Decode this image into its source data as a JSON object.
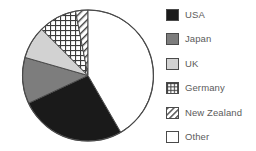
{
  "chart_data": {
    "type": "pie",
    "title": "",
    "categories": [
      "USA",
      "Japan",
      "UK",
      "Germany",
      "New Zealand",
      "Other"
    ],
    "values": [
      26.5,
      11.5,
      8.0,
      9.5,
      3.0,
      41.5
    ],
    "units": "percent",
    "start_angle_deg": 0,
    "direction": "clockwise",
    "legend_position": "right",
    "grid": false,
    "slices": [
      {
        "label": "USA",
        "value": 26.5,
        "start_deg": 150.0,
        "end_deg": 245.0,
        "fill": "#1a1a1a",
        "pattern": "solid"
      },
      {
        "label": "Japan",
        "value": 11.5,
        "start_deg": 245.0,
        "end_deg": 286.0,
        "fill": "#7d7d7d",
        "pattern": "solid"
      },
      {
        "label": "UK",
        "value": 8.0,
        "start_deg": 286.0,
        "end_deg": 315.0,
        "fill": "#d2d2d2",
        "pattern": "solid"
      },
      {
        "label": "Germany",
        "value": 9.5,
        "start_deg": 315.0,
        "end_deg": 349.0,
        "fill": "#ffffff",
        "pattern": "grid-dots"
      },
      {
        "label": "New Zealand",
        "value": 3.0,
        "start_deg": 349.0,
        "end_deg": 360.0,
        "fill": "#ffffff",
        "pattern": "diagonal-hatch"
      },
      {
        "label": "Other",
        "value": 41.5,
        "start_deg": 0.0,
        "end_deg": 150.0,
        "fill": "#ffffff",
        "pattern": "solid"
      }
    ],
    "colors": {
      "usa": "#1a1a1a",
      "japan": "#7d7d7d",
      "uk": "#d2d2d2",
      "germany": "#ffffff",
      "new_zealand": "#ffffff",
      "other": "#ffffff",
      "outline": "#4a4a4a",
      "label_text": "#5b5b5b",
      "background": "#ffffff"
    }
  },
  "legend": {
    "items": [
      {
        "label": "USA",
        "swatch": "solid-black-swatch"
      },
      {
        "label": "Japan",
        "swatch": "solid-gray-swatch"
      },
      {
        "label": "UK",
        "swatch": "solid-light-gray-swatch"
      },
      {
        "label": "Germany",
        "swatch": "grid-dots-swatch"
      },
      {
        "label": "New Zealand",
        "swatch": "diagonal-hatch-swatch"
      },
      {
        "label": "Other",
        "swatch": "solid-white-swatch"
      }
    ]
  }
}
